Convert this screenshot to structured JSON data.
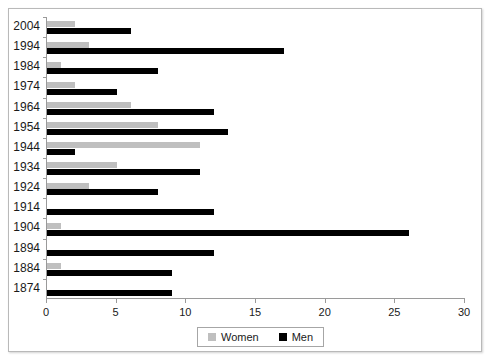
{
  "chart_data": {
    "type": "bar",
    "orientation": "horizontal",
    "title": "",
    "xlabel": "",
    "ylabel": "",
    "xlim": [
      0,
      30
    ],
    "ylim": null,
    "grid": false,
    "xticks": [
      0,
      5,
      10,
      15,
      20,
      25,
      30
    ],
    "xtick_labels": [
      "0",
      "5",
      "10",
      "15",
      "20",
      "25",
      "30"
    ],
    "categories": [
      "2004",
      "1994",
      "1984",
      "1974",
      "1964",
      "1954",
      "1944",
      "1934",
      "1924",
      "1914",
      "1904",
      "1894",
      "1884",
      "1874"
    ],
    "series": [
      {
        "name": "Women",
        "color": "#bfbfbf",
        "values": [
          2,
          3,
          1,
          2,
          6,
          8,
          11,
          5,
          3,
          0,
          1,
          0,
          1,
          0
        ]
      },
      {
        "name": "Men",
        "color": "#000000",
        "values": [
          6,
          17,
          8,
          5,
          12,
          13,
          2,
          11,
          8,
          12,
          26,
          12,
          9,
          9
        ]
      }
    ],
    "legend": {
      "position": "bottom",
      "entries": [
        {
          "label": "Women",
          "color": "#bfbfbf",
          "swatch": "women-swatch"
        },
        {
          "label": "Men",
          "color": "#000000",
          "swatch": "men-swatch"
        }
      ]
    },
    "axis_color": "#9a9a9a",
    "frame_color": "#b9b9b9",
    "background": "#ffffff"
  }
}
